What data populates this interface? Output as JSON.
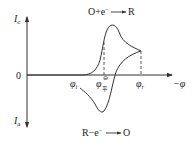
{
  "diagram": {
    "type": "cyclic_voltammogram",
    "axes": {
      "y_top_label": "I",
      "y_top_sub": "c",
      "y_bottom_label": "I",
      "y_bottom_sub": "a",
      "origin_label": "0",
      "x_label": "−φ"
    },
    "potential_marks": [
      {
        "symbol": "φ",
        "sub": "i",
        "name": "initial potential"
      },
      {
        "symbol": "φ",
        "sup": "⊖",
        "sub": "平",
        "name": "standard equilibrium potential"
      },
      {
        "symbol": "φ",
        "sub": "r",
        "name": "reversal potential"
      }
    ],
    "reactions": {
      "cathodic": "O+e⁻ ⟶ R",
      "anodic": "R−e⁻ ⟶ O"
    },
    "colors": {
      "line": "#333333",
      "background": "#ffffff"
    }
  }
}
